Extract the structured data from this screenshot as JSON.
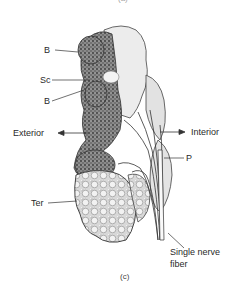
{
  "figure": {
    "top_caption_partial": "(a)",
    "caption": "(c)",
    "labels": {
      "b_upper": "B",
      "sc": "Sc",
      "b_lower": "B",
      "exterior": "Exterior",
      "interior": "Interior",
      "p": "P",
      "ter": "Ter",
      "nerve_line1": "Single nerve",
      "nerve_line2": "fiber"
    },
    "colors": {
      "ink": "#2a2a2a",
      "dark_stipple": "#6b6b6b",
      "light_tissue": "#e6e6e6",
      "background": "#ffffff"
    }
  }
}
